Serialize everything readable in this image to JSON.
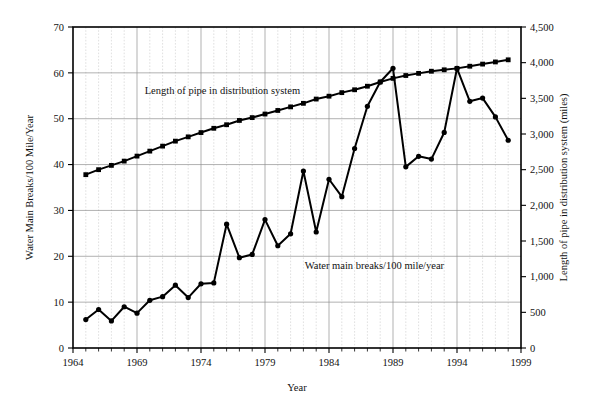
{
  "chart_data": {
    "type": "line",
    "title": "",
    "xlabel": "Year",
    "ylabel": "Water Main Breaks/100 Mile/Year",
    "y2label": "Length of pipe in distribution system (miles)",
    "xlim": [
      1964,
      1999
    ],
    "ylim": [
      0,
      70
    ],
    "y2lim": [
      0,
      4500
    ],
    "x_major_ticks": [
      1964,
      1969,
      1974,
      1979,
      1984,
      1989,
      1994,
      1999
    ],
    "x_major_tick_labels": [
      "1964",
      "1969",
      "1974",
      "1979",
      "1984",
      "1989",
      "1994",
      "1999"
    ],
    "x_minor_tick_step": 1,
    "y_ticks": [
      0,
      10,
      20,
      30,
      40,
      50,
      60,
      70
    ],
    "y_tick_labels": [
      "0",
      "10",
      "20",
      "30",
      "40",
      "50",
      "60",
      "70"
    ],
    "y2_ticks": [
      0,
      500,
      1000,
      1500,
      2000,
      2500,
      3000,
      3500,
      4000,
      4500
    ],
    "y2_tick_labels": [
      "0",
      "500",
      "1,000",
      "1,500",
      "2,000",
      "2,500",
      "3,000",
      "3,500",
      "4,000",
      "4,500"
    ],
    "grid": {
      "major_vertical": true,
      "minor_vertical": true,
      "major_horizontal": true,
      "horizontal_step": 10
    },
    "legend_position": "inline-annotation",
    "series": [
      {
        "name": "Length of pipe in distribution system",
        "axis": "right",
        "annotation": "Length of pipe in distribution system",
        "annotation_x": 1969.6,
        "annotation_y": 3560,
        "marker": "square",
        "x": [
          1965,
          1966,
          1967,
          1968,
          1969,
          1970,
          1971,
          1972,
          1973,
          1974,
          1975,
          1976,
          1977,
          1978,
          1979,
          1980,
          1981,
          1982,
          1983,
          1984,
          1985,
          1986,
          1987,
          1988,
          1989,
          1990,
          1991,
          1992,
          1993,
          1994,
          1995,
          1996,
          1997,
          1998
        ],
        "values": [
          2430,
          2500,
          2560,
          2620,
          2690,
          2760,
          2830,
          2900,
          2960,
          3020,
          3080,
          3130,
          3190,
          3230,
          3280,
          3330,
          3380,
          3430,
          3490,
          3530,
          3580,
          3620,
          3670,
          3730,
          3780,
          3820,
          3850,
          3880,
          3900,
          3920,
          3950,
          3980,
          4010,
          4040
        ]
      },
      {
        "name": "Water main breaks/100 mile/year",
        "axis": "left",
        "annotation": "Water main breaks/100 mile/year",
        "annotation_x": 1982.1,
        "annotation_y": 17.2,
        "marker": "circle",
        "x": [
          1965,
          1966,
          1967,
          1968,
          1969,
          1970,
          1971,
          1972,
          1973,
          1974,
          1975,
          1976,
          1977,
          1978,
          1979,
          1980,
          1981,
          1982,
          1983,
          1984,
          1985,
          1986,
          1987,
          1988,
          1989,
          1990,
          1991,
          1992,
          1993,
          1994,
          1995,
          1996,
          1997,
          1998
        ],
        "values": [
          6.2,
          8.4,
          5.9,
          9.0,
          7.6,
          10.4,
          11.2,
          13.7,
          11.0,
          14.0,
          14.2,
          27.0,
          19.7,
          20.4,
          28.0,
          22.3,
          24.9,
          38.6,
          25.3,
          36.8,
          33.0,
          43.5,
          52.7,
          58.0,
          61.0,
          39.5,
          41.8,
          41.2,
          47.0,
          61.0,
          53.8,
          54.5,
          50.4,
          45.3
        ]
      }
    ]
  },
  "axis_labels": {
    "left_title": "Water Main Breaks/100 Mile/Year",
    "right_title": "Length of pipe in distribution system (miles)",
    "bottom_title": "Year"
  }
}
